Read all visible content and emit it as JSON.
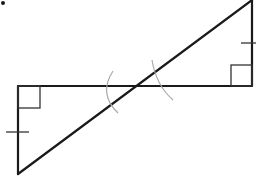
{
  "diagram": {
    "type": "geometry",
    "title": "",
    "colors": {
      "line": "#1a1a1a",
      "angle_arc": "#aaaaaa",
      "background": "#ffffff"
    },
    "dot": {
      "x": 3,
      "y": 3,
      "r": 2
    },
    "segments": [
      {
        "name": "horizontal-line",
        "x1": 18,
        "y1": 86,
        "x2": 252,
        "y2": 86
      },
      {
        "name": "left-leg",
        "x1": 18,
        "y1": 86,
        "x2": 18,
        "y2": 174
      },
      {
        "name": "right-leg",
        "x1": 252,
        "y1": 0,
        "x2": 252,
        "y2": 86
      },
      {
        "name": "transversal",
        "x1": 18,
        "y1": 174,
        "x2": 252,
        "y2": 0
      }
    ],
    "right_angles": [
      {
        "name": "right-angle-left",
        "x": 18,
        "y": 86,
        "w": 22,
        "h": 22
      },
      {
        "name": "right-angle-right",
        "x": 231,
        "y": 65,
        "w": 21,
        "h": 21
      }
    ],
    "tick_marks": [
      {
        "name": "tick-left-leg",
        "x1": 6,
        "y1": 132,
        "x2": 29,
        "y2": 132
      },
      {
        "name": "tick-right-leg",
        "x1": 241,
        "y1": 43,
        "x2": 256,
        "y2": 43
      }
    ],
    "angle_arcs": [
      {
        "name": "angle-arc-left",
        "path": "M 113 71 Q 98 94 118 113"
      },
      {
        "name": "angle-arc-right",
        "path": "M 152 60 Q 156 85 173 100"
      }
    ],
    "labels": []
  }
}
